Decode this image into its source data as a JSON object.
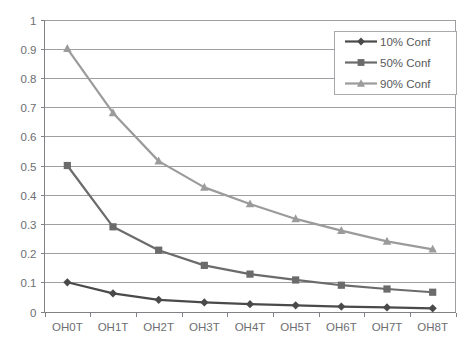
{
  "chart_data": {
    "type": "line",
    "title": "",
    "xlabel": "",
    "ylabel": "",
    "categories": [
      "OH0T",
      "OH1T",
      "OH2T",
      "OH3T",
      "OH4T",
      "OH5T",
      "OH6T",
      "OH7T",
      "OH8T"
    ],
    "y_ticks": [
      "0",
      "0.1",
      "0.2",
      "0.3",
      "0.4",
      "0.5",
      "0.6",
      "0.7",
      "0.8",
      "0.9",
      "1"
    ],
    "ylim": [
      0,
      1
    ],
    "grid": true,
    "legend_position": "top-right",
    "series": [
      {
        "name": "10% Conf",
        "marker": "diamond",
        "color": "#4a4a4a",
        "values": [
          0.1,
          0.062,
          0.04,
          0.031,
          0.025,
          0.021,
          0.017,
          0.014,
          0.011
        ]
      },
      {
        "name": "50% Conf",
        "marker": "square",
        "color": "#6b6b6b",
        "values": [
          0.5,
          0.29,
          0.21,
          0.158,
          0.128,
          0.108,
          0.09,
          0.077,
          0.066
        ]
      },
      {
        "name": "90% Conf",
        "marker": "triangle",
        "color": "#9b9b9b",
        "values": [
          0.9,
          0.68,
          0.515,
          0.425,
          0.368,
          0.317,
          0.277,
          0.24,
          0.213
        ]
      }
    ]
  },
  "legend": {
    "entries": [
      {
        "label": "10% Conf"
      },
      {
        "label": "50% Conf"
      },
      {
        "label": "90% Conf"
      }
    ]
  },
  "axes": {
    "y_tick_labels": [
      "1",
      "0.9",
      "0.8",
      "0.7",
      "0.6",
      "0.5",
      "0.4",
      "0.3",
      "0.2",
      "0.1",
      "0"
    ],
    "x_tick_labels": [
      "OH0T",
      "OH1T",
      "OH2T",
      "OH3T",
      "OH4T",
      "OH5T",
      "OH6T",
      "OH7T",
      "OH8T"
    ]
  },
  "colors": {
    "series_10": "#4a4a4a",
    "series_50": "#6b6b6b",
    "series_90": "#9b9b9b",
    "gridline": "#9d9fa2",
    "axis": "#808285",
    "text": "#6d6e71",
    "background": "#ffffff"
  }
}
